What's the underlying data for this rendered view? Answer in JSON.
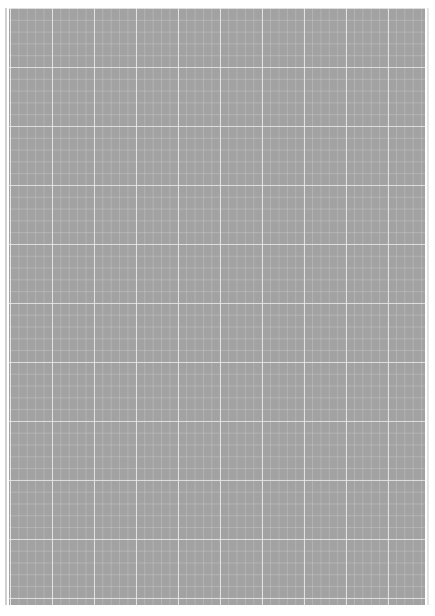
{
  "document": {
    "type": "grid-paper-scan",
    "text": "",
    "colors": {
      "paper": "#a2a2a2",
      "grid_major": "#ebebeb",
      "grid_minor": "#c8c8c8",
      "background": "#ffffff"
    }
  }
}
